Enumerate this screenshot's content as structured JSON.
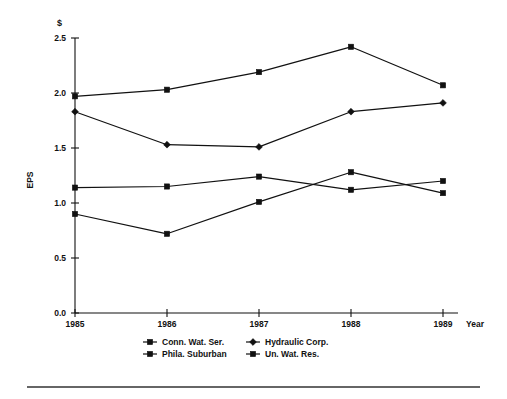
{
  "chart_data": {
    "type": "line",
    "title": "",
    "subtitle": "",
    "unit_symbol": "$",
    "xlabel": "Year",
    "ylabel": "EPS",
    "categories": [
      "1985",
      "1986",
      "1987",
      "1988",
      "1989"
    ],
    "x": [
      1985,
      1986,
      1987,
      1988,
      1989
    ],
    "xlim": [
      1985,
      1989
    ],
    "ylim": [
      0.0,
      2.5
    ],
    "ytick_labels": [
      "0.0",
      "0.5",
      "1.0",
      "1.5",
      "2.0",
      "2.5"
    ],
    "ytick_values": [
      0.0,
      0.5,
      1.0,
      1.5,
      2.0,
      2.5
    ],
    "xtick_labels": [
      "1985",
      "1986",
      "1987",
      "1988",
      "1989"
    ],
    "grid": false,
    "legend_position": "bottom",
    "series": [
      {
        "name": "Conn. Wat. Ser.",
        "marker": "square",
        "values": [
          1.97,
          2.03,
          2.19,
          2.42,
          2.07
        ]
      },
      {
        "name": "Phila. Suburban",
        "marker": "diamond",
        "values": [
          1.83,
          1.53,
          1.51,
          1.83,
          1.91
        ]
      },
      {
        "name": "Hydraulic Corp.",
        "marker": "square",
        "values": [
          1.14,
          1.15,
          1.24,
          1.12,
          1.2
        ]
      },
      {
        "name": "Un. Wat. Res.",
        "marker": "square",
        "values": [
          0.9,
          0.72,
          1.01,
          1.28,
          1.09
        ]
      }
    ]
  },
  "legend": {
    "items": [
      {
        "label": "Conn. Wat. Ser."
      },
      {
        "label": "Hydraulic Corp."
      },
      {
        "label": "Phila. Suburban"
      },
      {
        "label": "Un. Wat. Res."
      }
    ]
  },
  "axes": {
    "y_title": "EPS",
    "x_title": "Year",
    "currency": "$"
  }
}
